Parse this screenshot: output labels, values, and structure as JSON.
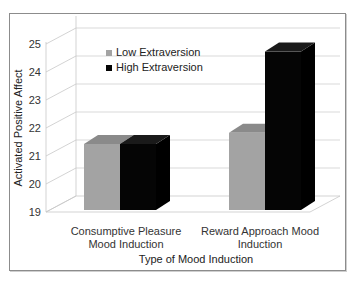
{
  "chart_data": {
    "type": "bar",
    "style": "3d-clustered-column",
    "title": "",
    "xlabel": "Type of Mood Induction",
    "ylabel": "Activated Positive Affect",
    "categories": [
      "Consumptive Pleasure Mood Induction",
      "Reward Approach Mood Induction"
    ],
    "category_lines": [
      [
        "Consumptive Pleasure",
        "Mood Induction"
      ],
      [
        "Reward Approach Mood",
        "Induction"
      ]
    ],
    "series": [
      {
        "name": "Low Extraversion",
        "values": [
          21.5,
          21.9
        ],
        "color": "#a3a3a3",
        "top_color": "#8a8a8a"
      },
      {
        "name": "High Extraversion",
        "values": [
          21.5,
          24.8
        ],
        "color": "#050505",
        "top_color": "#1a1a1a"
      }
    ],
    "ylim": [
      19,
      25
    ],
    "yticks": [
      19,
      20,
      21,
      22,
      23,
      24,
      25
    ],
    "grid": true,
    "legend": "top-left"
  }
}
